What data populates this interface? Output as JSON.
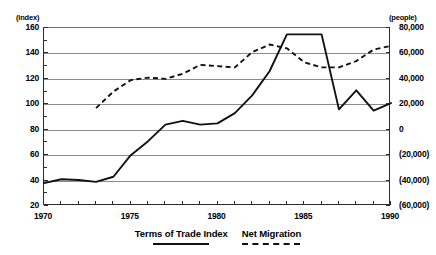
{
  "chart_data": {
    "type": "line",
    "title": "",
    "xlabel": "",
    "ylabel": "index",
    "grid": true,
    "legend_position": "bottom-center",
    "x": [
      1970,
      1971,
      1972,
      1973,
      1974,
      1975,
      1976,
      1977,
      1978,
      1979,
      1980,
      1981,
      1982,
      1983,
      1984,
      1985,
      1986,
      1987,
      1988,
      1989,
      1990
    ],
    "xlim": [
      1970,
      1990
    ],
    "xtick_labels": [
      "1970",
      "1975",
      "1980",
      "1985",
      "1990"
    ],
    "xtick_values": [
      1970,
      1975,
      1980,
      1985,
      1990
    ],
    "axes": [
      {
        "id": "left",
        "unit_label": "(index)",
        "ylim": [
          20,
          160
        ],
        "ytick_labels": [
          "20",
          "40",
          "60",
          "80",
          "100",
          "120",
          "140",
          "160"
        ],
        "ytick_values": [
          20,
          40,
          60,
          80,
          100,
          120,
          140,
          160
        ]
      },
      {
        "id": "right",
        "unit_label": "(people)",
        "ylim": [
          -60000,
          80000
        ],
        "ytick_labels": [
          "(60,000)",
          "(40,000)",
          "(20,000)",
          "0",
          "20,000",
          "40,000",
          "60,000",
          "80,000"
        ],
        "ytick_values": [
          -60000,
          -40000,
          -20000,
          0,
          20000,
          40000,
          60000,
          80000
        ]
      }
    ],
    "series": [
      {
        "name": "Terms of Trade Index",
        "axis": "left",
        "style": "solid",
        "color": "#111111",
        "values": [
          38,
          41,
          40.5,
          39,
          43,
          60,
          71,
          84,
          87,
          84,
          85,
          93,
          107,
          126,
          155,
          155,
          155,
          96,
          111,
          95,
          101
        ]
      },
      {
        "name": "Net Migration",
        "axis": "right",
        "style": "dashed",
        "color": "#111111",
        "x": [
          1973,
          1974,
          1975,
          1976,
          1977,
          1978,
          1979,
          1980,
          1981,
          1982,
          1983,
          1984,
          1985,
          1986,
          1987,
          1988,
          1989,
          1990
        ],
        "values": [
          97,
          110,
          119,
          121,
          120,
          124,
          131,
          130,
          129,
          141,
          147,
          144,
          133,
          129,
          129,
          134,
          143,
          146
        ],
        "values_people": [
          3500,
          20000,
          29000,
          31000,
          30000,
          34000,
          41000,
          40000,
          39000,
          51000,
          57000,
          54000,
          43000,
          39000,
          39000,
          44000,
          53000,
          56000
        ]
      }
    ],
    "legend": [
      {
        "label": "Terms of Trade Index",
        "style": "solid"
      },
      {
        "label": "Net Migration",
        "style": "dashed"
      }
    ]
  }
}
